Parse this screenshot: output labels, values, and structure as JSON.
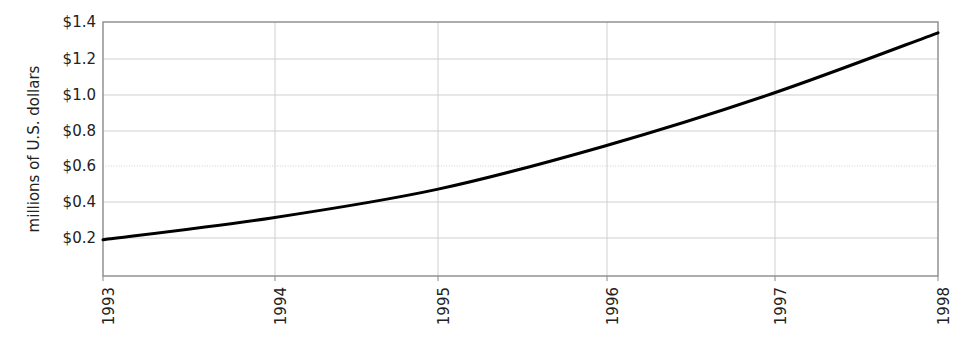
{
  "chart_data": {
    "type": "line",
    "title": "",
    "subtitle": "",
    "xlabel": "",
    "ylabel": "millions of U.S. dollars",
    "x": [
      1993,
      1994,
      1995,
      1996,
      1997,
      1998
    ],
    "categories": [
      "1993",
      "1994",
      "1995",
      "1996",
      "1997",
      "1998"
    ],
    "values": [
      0.19,
      0.31,
      0.47,
      0.71,
      1.0,
      1.34
    ],
    "series": [
      {
        "name": "millions of U.S. dollars",
        "values": [
          0.19,
          0.31,
          0.47,
          0.71,
          1.0,
          1.34
        ]
      }
    ],
    "xlim": [
      1993,
      1998
    ],
    "ylim": [
      0.0,
      1.4
    ],
    "y_ticks": [
      0.2,
      0.4,
      0.6,
      0.8,
      1.0,
      1.2,
      1.4
    ],
    "y_tick_labels": [
      "$0.2",
      "$0.4",
      "$0.6",
      "$0.8",
      "$1.0",
      "$1.2",
      "$1.4"
    ],
    "x_tick_labels": [
      "1993",
      "1994",
      "1995",
      "1996",
      "1997",
      "1998"
    ],
    "x_tick_label_rotation": 90,
    "grid": true,
    "grid_axis": "y",
    "legend": false,
    "legend_position": "none",
    "line_color": "#000000",
    "line_width": 3,
    "grid_color": "#cccccc",
    "frame_color": "#888888",
    "background_color": "#ffffff",
    "markers": false,
    "annotations": []
  },
  "axes": {
    "y_title": "millions of U.S. dollars",
    "y_labels": [
      "$1.4",
      "$1.2",
      "$1.0",
      "$0.8",
      "$0.6",
      "$0.4",
      "$0.2"
    ],
    "x_labels": [
      "1993",
      "1994",
      "1995",
      "1996",
      "1997",
      "1998"
    ]
  }
}
